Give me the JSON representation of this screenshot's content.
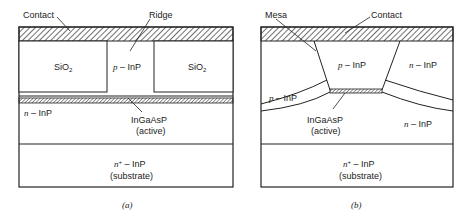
{
  "figure": {
    "panel_a": {
      "caption": "(a)",
      "labels": {
        "contact": "Contact",
        "ridge": "Ridge",
        "sio2_left": "SiO",
        "sio2_right": "SiO",
        "sio2_subscript": "2",
        "ridge_layer_prefix": "p",
        "ridge_layer": " – InP",
        "n_layer_prefix": "n",
        "n_layer": " – InP",
        "active_line1": "InGaAsP",
        "active_line2": "(active)",
        "substrate_prefix": "n",
        "substrate_sup": "+",
        "substrate_line1": " – InP",
        "substrate_line2": "(substrate)"
      }
    },
    "panel_b": {
      "caption": "(b)",
      "labels": {
        "mesa": "Mesa",
        "contact": "Contact",
        "mesa_layer_prefix": "p",
        "mesa_layer": " – InP",
        "right_upper_prefix": "n",
        "right_upper": " – InP",
        "left_block_prefix": "p",
        "left_block": " – InP",
        "right_lower_prefix": "n",
        "right_lower": " – InP",
        "active_line1": "InGaAsP",
        "active_line2": "(active)",
        "substrate_prefix": "n",
        "substrate_sup": "+",
        "substrate_line1": " – InP",
        "substrate_line2": "(substrate)"
      }
    },
    "colors": {
      "line": "#222222",
      "background": "#ffffff"
    }
  }
}
